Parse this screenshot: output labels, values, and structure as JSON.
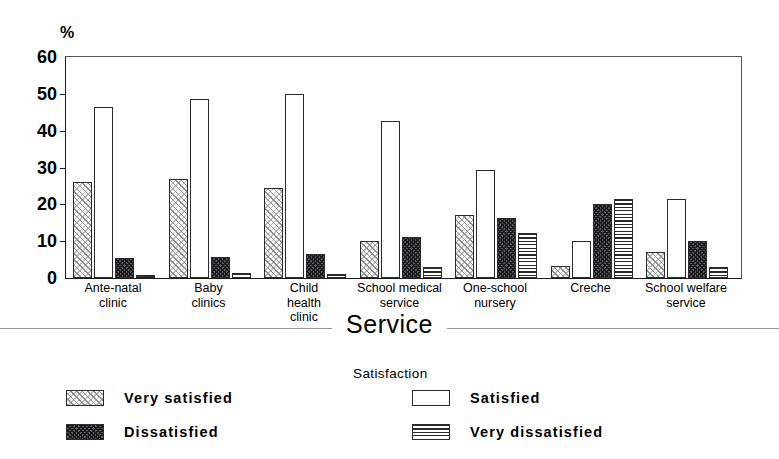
{
  "chart_data": {
    "type": "bar",
    "title": "",
    "xlabel": "Service",
    "ylabel": "%",
    "ylim": [
      0,
      60
    ],
    "yticks": [
      0,
      10,
      20,
      30,
      40,
      50,
      60
    ],
    "grid": false,
    "legend_position": "bottom",
    "legend_title": "Satisfaction",
    "categories": [
      "Ante-natal\nclinic",
      "Baby\nclinics",
      "Child\nhealth\nclinic",
      "School medical\nservice",
      "One-school\nnursery",
      "Creche",
      "School welfare\nservice"
    ],
    "series": [
      {
        "name": "Very satisfied",
        "pattern": "diagonal-hatch-light",
        "values": [
          26.0,
          26.8,
          24.5,
          10.0,
          17.0,
          3.3,
          7.0
        ]
      },
      {
        "name": "Satisfied",
        "pattern": "white-empty",
        "values": [
          46.3,
          48.5,
          50.0,
          42.5,
          29.3,
          10.0,
          21.5
        ]
      },
      {
        "name": "Dissatisfied",
        "pattern": "dark-crosshatch",
        "values": [
          5.5,
          5.6,
          6.5,
          11.0,
          16.3,
          20.2,
          10.0
        ]
      },
      {
        "name": "Very dissatisfied",
        "pattern": "horizontal-lines",
        "values": [
          0.7,
          1.3,
          1.0,
          3.0,
          12.2,
          21.5,
          3.0
        ]
      }
    ]
  },
  "legend": {
    "title": "Satisfaction",
    "items": [
      {
        "label": "Very satisfied"
      },
      {
        "label": "Satisfied"
      },
      {
        "label": "Dissatisfied"
      },
      {
        "label": "Very dissatisfied"
      }
    ]
  },
  "axis": {
    "y_unit": "%",
    "x_title": "Service"
  }
}
